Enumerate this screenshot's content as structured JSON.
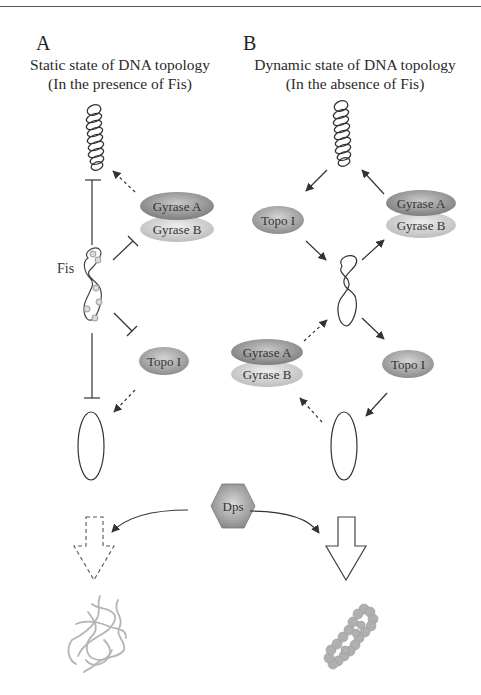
{
  "panels": {
    "A": {
      "letter": "A",
      "title_line1": "Static state of DNA topology",
      "title_line2": "(In the presence of Fis)"
    },
    "B": {
      "letter": "B",
      "title_line1": "Dynamic state of DNA topology",
      "title_line2": "(In the absence of Fis)"
    }
  },
  "labels": {
    "fis": "Fis",
    "gyrase_a": "Gyrase A",
    "gyrase_b": "Gyrase B",
    "topo1": "Topo I",
    "dps": "Dps"
  },
  "colors": {
    "gyrase_a": "#9a9a9a",
    "gyrase_b": "#cfcfcf",
    "topo1": "#a8a8a8",
    "dps": "#9c9c9c",
    "line": "#333333",
    "chromatin": "#b5b5b5"
  },
  "nodes": {
    "A": [
      "supercoiled DNA",
      "Fis-bound DNA (intermediate)",
      "relaxed DNA (circle)"
    ],
    "B": [
      "supercoiled DNA",
      "intermediate DNA",
      "relaxed DNA (circle)"
    ]
  },
  "outcomes": {
    "A": "dashed open arrow to loose nucleoid",
    "B": "solid open arrow to compacted nucleoid"
  }
}
